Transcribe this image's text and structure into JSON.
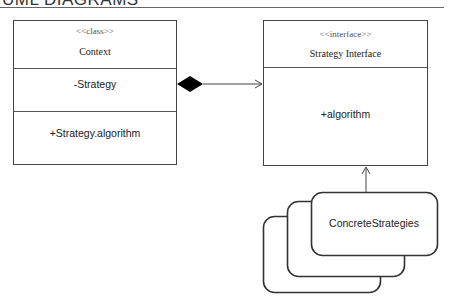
{
  "title": "UML DIAGRAMS",
  "context_class": {
    "stereotype": "<<class>>",
    "name": "Context",
    "attribute": "-Strategy",
    "operation": "+Strategy.algorithm"
  },
  "strategy_interface": {
    "stereotype": "<<interface>>",
    "name": "Strategy Interface",
    "operation": "+algorithm"
  },
  "concrete": {
    "label": "ConcreteStrategies"
  },
  "relations": {
    "aggregation": "Context composition Strategy Interface",
    "realization": "ConcreteStrategies to Strategy Interface"
  },
  "colors": {
    "stroke": "#444444",
    "diamond": "#000000"
  }
}
